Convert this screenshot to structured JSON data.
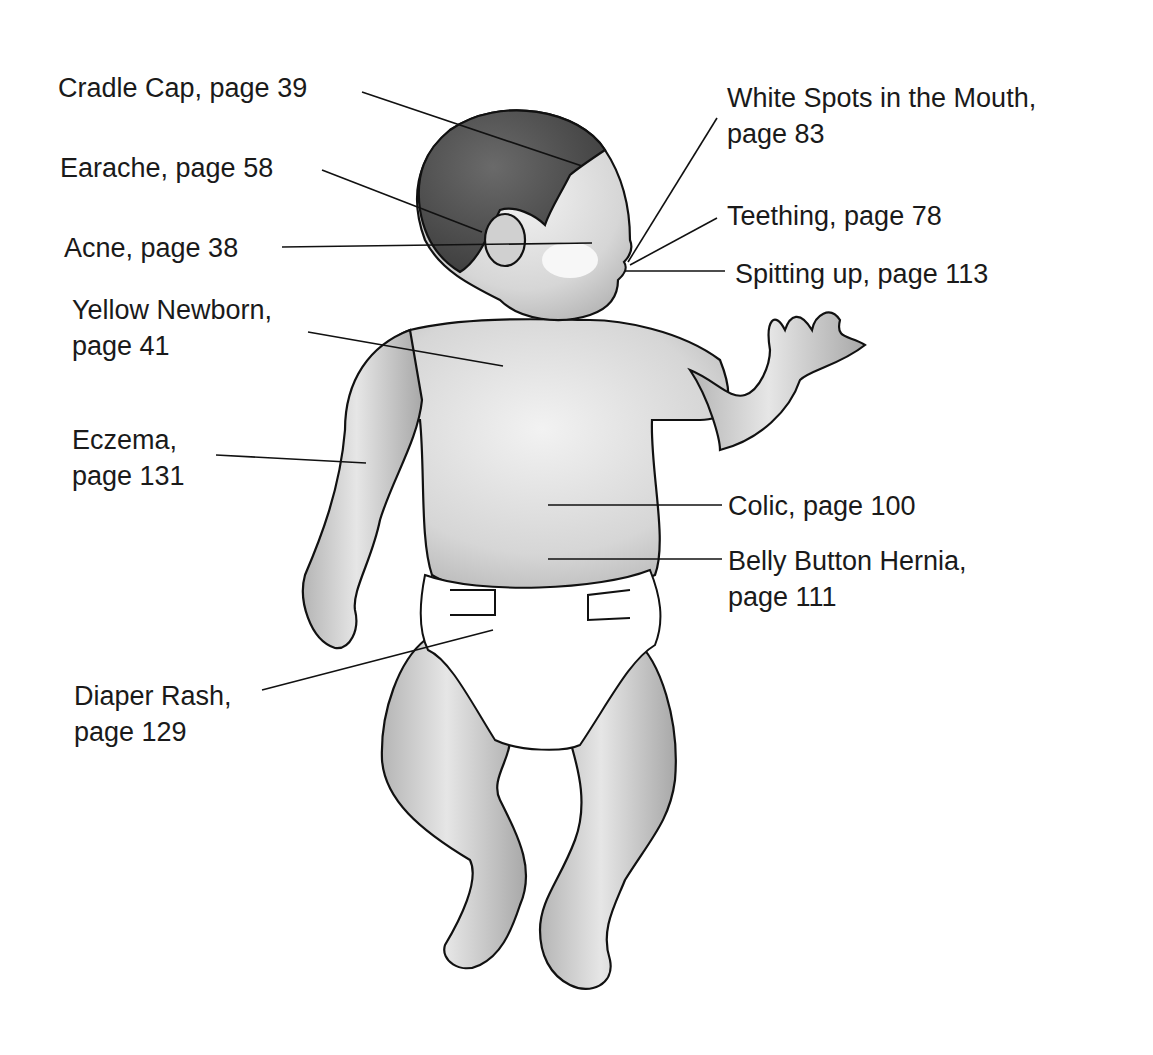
{
  "diagram": {
    "colors": {
      "background": "#ffffff",
      "text": "#1a1a1a",
      "outline": "#111111",
      "skin_light": "#e6e6e6",
      "skin_mid": "#c4c4c4",
      "hair": "#555555",
      "diaper": "#ffffff"
    },
    "labels": [
      {
        "id": "cradle-cap",
        "lines": [
          "Cradle Cap, page 39"
        ],
        "x": 58,
        "y": 70
      },
      {
        "id": "earache",
        "lines": [
          "Earache, page 58"
        ],
        "x": 60,
        "y": 150
      },
      {
        "id": "acne",
        "lines": [
          "Acne, page 38"
        ],
        "x": 64,
        "y": 230
      },
      {
        "id": "yellow-newborn",
        "lines": [
          "Yellow Newborn,",
          "page 41"
        ],
        "x": 72,
        "y": 292
      },
      {
        "id": "eczema",
        "lines": [
          "Eczema,",
          "page 131"
        ],
        "x": 72,
        "y": 422
      },
      {
        "id": "diaper-rash",
        "lines": [
          "Diaper Rash,",
          "page 129"
        ],
        "x": 74,
        "y": 678
      },
      {
        "id": "white-spots",
        "lines": [
          "White Spots in the Mouth,",
          "page 83"
        ],
        "x": 727,
        "y": 80
      },
      {
        "id": "teething",
        "lines": [
          "Teething, page 78"
        ],
        "x": 727,
        "y": 198
      },
      {
        "id": "spitting-up",
        "lines": [
          "Spitting up, page 113"
        ],
        "x": 735,
        "y": 256
      },
      {
        "id": "colic",
        "lines": [
          "Colic, page 100"
        ],
        "x": 728,
        "y": 488
      },
      {
        "id": "belly-button-hernia",
        "lines": [
          "Belly Button Hernia,",
          "page 111"
        ],
        "x": 728,
        "y": 543
      }
    ],
    "leaders": [
      {
        "for": "cradle-cap",
        "x1": 362,
        "y1": 92,
        "x2": 582,
        "y2": 166
      },
      {
        "for": "earache",
        "x1": 322,
        "y1": 170,
        "x2": 482,
        "y2": 232
      },
      {
        "for": "acne",
        "x1": 282,
        "y1": 247,
        "x2": 592,
        "y2": 243
      },
      {
        "for": "yellow-newborn",
        "x1": 308,
        "y1": 332,
        "x2": 503,
        "y2": 366
      },
      {
        "for": "eczema",
        "x1": 216,
        "y1": 455,
        "x2": 366,
        "y2": 463
      },
      {
        "for": "diaper-rash",
        "x1": 262,
        "y1": 690,
        "x2": 493,
        "y2": 630
      },
      {
        "for": "white-spots",
        "x1": 717,
        "y1": 118,
        "x2": 628,
        "y2": 262
      },
      {
        "for": "teething",
        "x1": 717,
        "y1": 218,
        "x2": 630,
        "y2": 265
      },
      {
        "for": "spitting-up",
        "x1": 725,
        "y1": 271,
        "x2": 625,
        "y2": 271
      },
      {
        "for": "colic",
        "x1": 722,
        "y1": 505,
        "x2": 548,
        "y2": 505
      },
      {
        "for": "belly-button-hernia",
        "x1": 722,
        "y1": 559,
        "x2": 548,
        "y2": 559
      }
    ]
  }
}
